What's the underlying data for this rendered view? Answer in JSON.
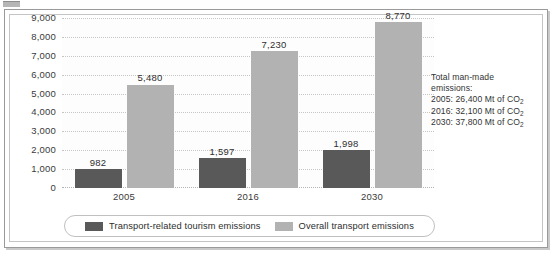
{
  "chart_data": {
    "type": "bar",
    "title": "",
    "xlabel": "",
    "ylabel": "",
    "ylim": [
      0,
      9000
    ],
    "ytick_step": 1000,
    "grid": true,
    "legend_position": "bottom",
    "categories": [
      "2005",
      "2016",
      "2030"
    ],
    "ytick_labels": [
      "9,000",
      "8,000",
      "7,000",
      "6,000",
      "5,000",
      "4,000",
      "3,000",
      "2,000",
      "1,000",
      "0"
    ],
    "ytick_values": [
      9000,
      8000,
      7000,
      6000,
      5000,
      4000,
      3000,
      2000,
      1000,
      0
    ],
    "series": [
      {
        "name": "Transport-related tourism emissions",
        "color": "#595959",
        "values": [
          982,
          1597,
          1998
        ],
        "labels": [
          "982",
          "1,597",
          "1,998"
        ]
      },
      {
        "name": "Overall transport emissions",
        "color": "#b2b2b2",
        "values": [
          5480,
          7230,
          8770
        ],
        "labels": [
          "5,480",
          "7,230",
          "8,770"
        ]
      }
    ]
  },
  "annotation": {
    "lines": [
      "Total man-made",
      "emissions:"
    ],
    "entries": [
      {
        "year": "2005",
        "value": "26,400 Mt of CO",
        "sub": "2"
      },
      {
        "year": "2016",
        "value": "32,100 Mt of CO",
        "sub": "2"
      },
      {
        "year": "2030",
        "value": "37,800 Mt of CO",
        "sub": "2"
      }
    ]
  },
  "colors": {
    "series_dark": "#595959",
    "series_light": "#b2b2b2",
    "frame_border": "#9a9a9a",
    "gridline": "#c6c6c6"
  }
}
